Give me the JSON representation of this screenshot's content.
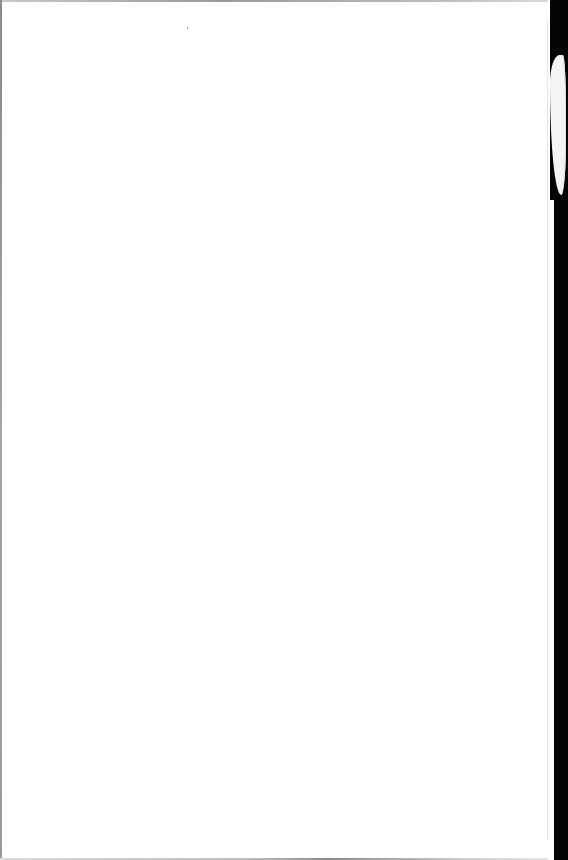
{
  "document": {
    "type": "scanned-page",
    "content": "",
    "is_blank": true,
    "colors": {
      "paper": "#ffffff",
      "scan_border": "#050505",
      "edge_shadow": "#9a9a9a"
    }
  }
}
